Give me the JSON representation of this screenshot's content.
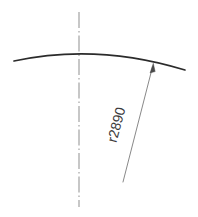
{
  "drawing": {
    "title": "arc-radius-dimension-drawing",
    "background_color": "#ffffff",
    "line_color": "#2b2b2b",
    "centerline_color": "#9a9a9a",
    "leader_color": "#7a7a7a",
    "text_color": "#3a3a3a",
    "annotations": {
      "radius_label": "r2890"
    },
    "geometry": {
      "arc": {
        "name": "shallow-arc",
        "start_x": 14,
        "start_y": 61,
        "end_x": 185,
        "end_y": 70,
        "apex_x": 79,
        "apex_y": 51,
        "radius": 2890,
        "path": "M 14 61 Q 97 43 185 70"
      },
      "centerline": {
        "name": "vertical-centerline",
        "x": 79,
        "y_top": 12,
        "y_bottom": 207,
        "style": "dash-dot"
      },
      "leader": {
        "name": "radius-leader-line",
        "tip_x": 153,
        "tip_y": 66,
        "tail_x": 123,
        "tail_y": 182,
        "arrow_at": "tip"
      },
      "label_placement": {
        "x": 121,
        "y": 126,
        "rotation_deg": -75
      }
    }
  }
}
